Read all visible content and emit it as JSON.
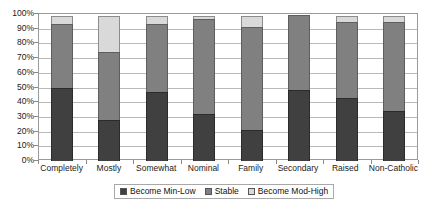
{
  "chart_data": {
    "type": "bar",
    "subtype": "100% stacked column",
    "title": "",
    "subtitle": "",
    "xlabel": "",
    "ylabel": "",
    "ylim": [
      0,
      100
    ],
    "yticks": [
      "0%",
      "10%",
      "20%",
      "30%",
      "40%",
      "50%",
      "60%",
      "70%",
      "80%",
      "90%",
      "100%"
    ],
    "ytick_values": [
      0,
      10,
      20,
      30,
      40,
      50,
      60,
      70,
      80,
      90,
      100
    ],
    "grid": true,
    "legend_position": "bottom",
    "categories": [
      "Completely",
      "Mostly",
      "Somewhat",
      "Nominal",
      "Family",
      "Secondary",
      "Raised",
      "Non-Catholic"
    ],
    "series": [
      {
        "name": "Become Min-Low",
        "color": "#404040",
        "values": [
          50,
          28,
          47,
          32,
          21,
          48,
          43,
          34
        ]
      },
      {
        "name": "Stable",
        "color": "#808080",
        "values": [
          44,
          47,
          47,
          65,
          71,
          52,
          52,
          61
        ]
      },
      {
        "name": "Become Mod-High",
        "color": "#d9d9d9",
        "values": [
          6,
          25,
          6,
          3,
          8,
          0,
          5,
          5
        ]
      }
    ]
  },
  "legend": {
    "items": [
      {
        "label": "Become Min-Low",
        "swatch": "#404040"
      },
      {
        "label": "Stable",
        "swatch": "#808080"
      },
      {
        "label": "Become Mod-High",
        "swatch": "#d9d9d9"
      }
    ]
  }
}
